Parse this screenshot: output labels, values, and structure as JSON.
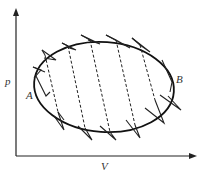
{
  "diagram": {
    "type": "pV-diagram",
    "axes": {
      "y_label": "p",
      "x_label": "V"
    },
    "points": {
      "left": "A",
      "right": "B"
    },
    "elements": {
      "cycle": "ellipse",
      "approximation": "zigzag of Carnot cycles (isotherms solid, adiabats dashed inside)"
    },
    "colors": {
      "line": "#222222",
      "label": "#333333",
      "background": "#ffffff"
    }
  }
}
